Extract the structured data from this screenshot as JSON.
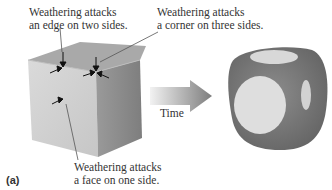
{
  "figure": {
    "panel_label": "(a)",
    "annotations": {
      "edge": {
        "line1": "Weathering attacks",
        "line2": "an edge on two sides."
      },
      "corner": {
        "line1": "Weathering attacks",
        "line2": "a corner on three sides."
      },
      "face": {
        "line1": "Weathering attacks",
        "line2": "a face on one side."
      }
    },
    "arrow_label": "Time",
    "colors": {
      "cube_front": "#d2d2d2",
      "cube_top": "#a8a8a8",
      "cube_side": "#8a8a8a",
      "rounded_dark": "#7a7a7a",
      "rounded_light": "#dcdcdc",
      "arrow": "#9a9a9a"
    }
  }
}
